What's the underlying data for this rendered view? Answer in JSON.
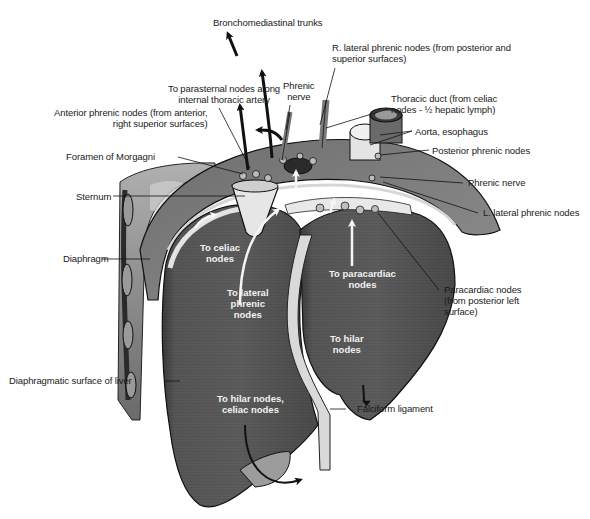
{
  "figure": {
    "type": "anatomical illustration",
    "colors": {
      "liver": "#5a5a5a",
      "liver_dark": "#3c3c3c",
      "diaphragm": "#8a8a8a",
      "diaphragm_light": "#c8c8c8",
      "ligament": "#d8d8d8",
      "outline": "#1a1a1a",
      "white_arrow": "#f5f5f5",
      "black_arrow": "#111111"
    }
  },
  "labels": {
    "bronchomediastinal": "Bronchomediastinal trunks",
    "parasternal": [
      "To parasternal nodes along",
      "internal thoracic artery"
    ],
    "phrenic_nerve_top": [
      "Phrenic",
      "nerve"
    ],
    "r_lateral_phrenic": [
      "R. lateral phrenic nodes (from posterior and",
      "superior surfaces)"
    ],
    "thoracic_duct": [
      "Thoracic duct (from celiac",
      "nodes - ½ hepatic lymph)"
    ],
    "anterior_phrenic": [
      "Anterior phrenic nodes (from anterior,",
      "right superior surfaces)"
    ],
    "aorta_esophagus": "Aorta, esophagus",
    "foramen_morgagni": "Foramen of Morgagni",
    "posterior_phrenic": "Posterior phrenic nodes",
    "sternum": "Sternum",
    "phrenic_nerve_right": "Phrenic nerve",
    "l_lateral_phrenic": "L. lateral phrenic nodes",
    "diaphragm": "Diaphragm",
    "paracardiac": [
      "Paracardiac nodes",
      "(from posterior left",
      "surface)"
    ],
    "diaphragmatic_surface": "Diaphragmatic surface of liver",
    "falciform": "Falciform ligament"
  },
  "inner_labels": {
    "to_celiac": [
      "To celiac",
      "nodes"
    ],
    "to_lateral_phrenic": [
      "To lateral",
      "phrenic",
      "nodes"
    ],
    "to_paracardiac": [
      "To paracardiac",
      "nodes"
    ],
    "to_hilar": [
      "To hilar",
      "nodes"
    ],
    "to_hilar_celiac": [
      "To hilar nodes,",
      "celiac nodes"
    ]
  }
}
